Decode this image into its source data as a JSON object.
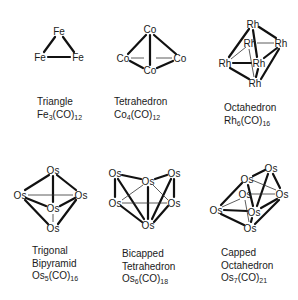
{
  "clusters": [
    {
      "id": "triangle",
      "shape": "Triangle",
      "formula": {
        "metal": "Fe",
        "n": "3",
        "ligand": "(CO)",
        "m": "12"
      },
      "atoms": [
        {
          "el": "Fe",
          "x": 59,
          "y": 31
        },
        {
          "el": "Fe",
          "x": 40,
          "y": 57
        },
        {
          "el": "Fe",
          "x": 78,
          "y": 57
        }
      ]
    },
    {
      "id": "tetrahedron",
      "shape": "Tetrahedron",
      "formula": {
        "metal": "Co",
        "n": "4",
        "ligand": "(CO)",
        "m": "12"
      },
      "atoms": [
        {
          "el": "Co",
          "x": 150,
          "y": 29
        },
        {
          "el": "Co",
          "x": 123,
          "y": 58
        },
        {
          "el": "Co",
          "x": 180,
          "y": 58
        },
        {
          "el": "Co",
          "x": 150,
          "y": 70
        }
      ]
    },
    {
      "id": "octahedron",
      "shape": "Octahedron",
      "formula": {
        "metal": "Rh",
        "n": "6",
        "ligand": "(CO)",
        "m": "16"
      },
      "atoms": [
        {
          "el": "Rh",
          "x": 253,
          "y": 24
        },
        {
          "el": "Rh",
          "x": 250,
          "y": 43
        },
        {
          "el": "Rh",
          "x": 281,
          "y": 43
        },
        {
          "el": "Rh",
          "x": 225,
          "y": 63
        },
        {
          "el": "Rh",
          "x": 259,
          "y": 63
        },
        {
          "el": "Rh",
          "x": 255,
          "y": 83
        }
      ]
    },
    {
      "id": "trigonal-bipyramid",
      "shape_lines": [
        "Trigonal",
        "Bipyramid"
      ],
      "formula": {
        "metal": "Os",
        "n": "5",
        "ligand": "(CO)",
        "m": "16"
      },
      "atoms": [
        {
          "el": "Os",
          "x": 53,
          "y": 170
        },
        {
          "el": "Os",
          "x": 20,
          "y": 195
        },
        {
          "el": "Os",
          "x": 81,
          "y": 195
        },
        {
          "el": "Os",
          "x": 53,
          "y": 208
        },
        {
          "el": "Os",
          "x": 53,
          "y": 228
        }
      ]
    },
    {
      "id": "bicapped-tetrahedron",
      "shape_lines": [
        "Bicapped",
        "Tetrahedron"
      ],
      "formula": {
        "metal": "Os",
        "n": "6",
        "ligand": "(CO)",
        "m": "18"
      },
      "atoms": [
        {
          "el": "Os",
          "x": 115,
          "y": 173
        },
        {
          "el": "Os",
          "x": 148,
          "y": 181
        },
        {
          "el": "Os",
          "x": 174,
          "y": 173
        },
        {
          "el": "Os",
          "x": 115,
          "y": 203
        },
        {
          "el": "Os",
          "x": 174,
          "y": 203
        },
        {
          "el": "Os",
          "x": 148,
          "y": 225
        }
      ]
    },
    {
      "id": "capped-octahedron",
      "shape_lines": [
        "Capped",
        "Octahedron"
      ],
      "formula": {
        "metal": "Os",
        "n": "7",
        "ligand": "(CO)",
        "m": "21"
      },
      "atoms": [
        {
          "el": "Os",
          "x": 271,
          "y": 168
        },
        {
          "el": "Os",
          "x": 247,
          "y": 179
        },
        {
          "el": "Os",
          "x": 245,
          "y": 194
        },
        {
          "el": "Os",
          "x": 282,
          "y": 194
        },
        {
          "el": "Os",
          "x": 216,
          "y": 210
        },
        {
          "el": "Os",
          "x": 254,
          "y": 212
        },
        {
          "el": "Os",
          "x": 250,
          "y": 228
        }
      ]
    }
  ],
  "labels": {
    "triangle": {
      "line1": "Triangle",
      "metal": "Fe",
      "n": "3",
      "ligand": "(CO)",
      "m": "12"
    },
    "tetrahedron": {
      "line1": "Tetrahedron",
      "metal": "Co",
      "n": "4",
      "ligand": "(CO)",
      "m": "12"
    },
    "octahedron": {
      "line1": "Octahedron",
      "metal": "Rh",
      "n": "6",
      "ligand": "(CO)",
      "m": "16"
    },
    "tbp": {
      "line1": "Trigonal",
      "line2": "Bipyramid",
      "metal": "Os",
      "n": "5",
      "ligand": "(CO)",
      "m": "16"
    },
    "bicapped": {
      "line1": "Bicapped",
      "line2": "Tetrahedron",
      "metal": "Os",
      "n": "6",
      "ligand": "(CO)",
      "m": "18"
    },
    "capped": {
      "line1": "Capped",
      "line2": "Octahedron",
      "metal": "Os",
      "n": "7",
      "ligand": "(CO)",
      "m": "21"
    }
  },
  "colors": {
    "ink": "#1a1a1a",
    "background": "#ffffff"
  }
}
